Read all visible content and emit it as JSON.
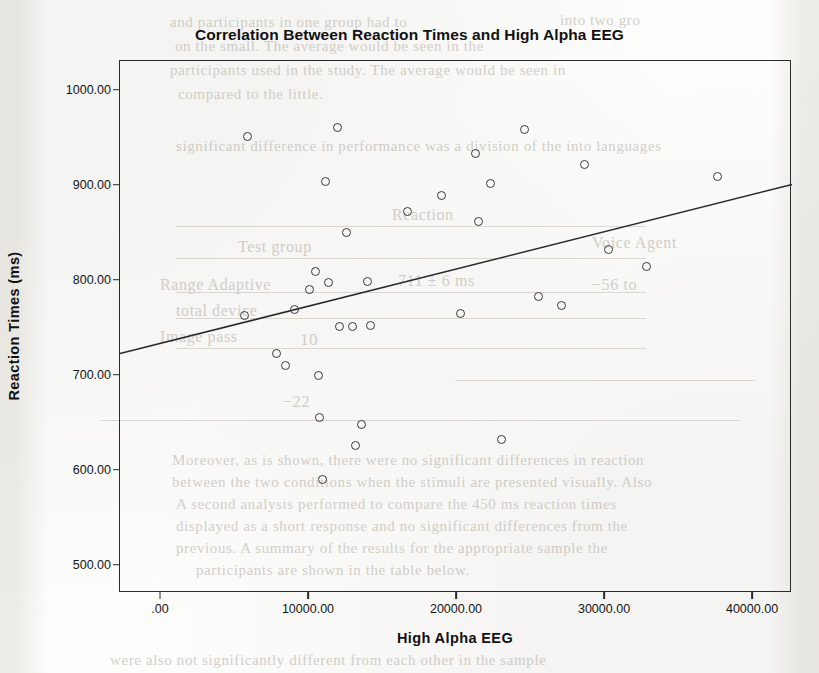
{
  "chart_data": {
    "type": "scatter",
    "title": "Correlation Between Reaction Times and High Alpha EEG",
    "xlabel": "High Alpha EEG",
    "ylabel": "Reaction Times (ms)",
    "grid": false,
    "legend": "none",
    "xlim": [
      -2700,
      42700
    ],
    "ylim": [
      470,
      1030
    ],
    "xticks": [
      0,
      10000,
      20000,
      30000,
      40000
    ],
    "xtick_labels": [
      ".00",
      "10000.00",
      "20000.00",
      "30000.00",
      "40000.00"
    ],
    "yticks": [
      500,
      600,
      700,
      800,
      900,
      1000
    ],
    "ytick_labels": [
      "500.00",
      "600.00",
      "700.00",
      "800.00",
      "900.00",
      "1000.00"
    ],
    "marker": "open-circle",
    "points": [
      {
        "x": 5900,
        "y": 951
      },
      {
        "x": 5700,
        "y": 762
      },
      {
        "x": 7900,
        "y": 722
      },
      {
        "x": 8500,
        "y": 710
      },
      {
        "x": 9100,
        "y": 768
      },
      {
        "x": 10100,
        "y": 790
      },
      {
        "x": 10500,
        "y": 808
      },
      {
        "x": 10700,
        "y": 699
      },
      {
        "x": 10800,
        "y": 655
      },
      {
        "x": 11000,
        "y": 589
      },
      {
        "x": 11200,
        "y": 903
      },
      {
        "x": 11400,
        "y": 797
      },
      {
        "x": 12000,
        "y": 960
      },
      {
        "x": 12100,
        "y": 751
      },
      {
        "x": 12600,
        "y": 849
      },
      {
        "x": 13000,
        "y": 751
      },
      {
        "x": 13200,
        "y": 625
      },
      {
        "x": 13600,
        "y": 647
      },
      {
        "x": 14000,
        "y": 798
      },
      {
        "x": 14200,
        "y": 752
      },
      {
        "x": 16700,
        "y": 872
      },
      {
        "x": 19000,
        "y": 888
      },
      {
        "x": 20300,
        "y": 764
      },
      {
        "x": 21300,
        "y": 933
      },
      {
        "x": 21500,
        "y": 861
      },
      {
        "x": 22300,
        "y": 901
      },
      {
        "x": 23100,
        "y": 632
      },
      {
        "x": 24600,
        "y": 958
      },
      {
        "x": 25600,
        "y": 782
      },
      {
        "x": 27100,
        "y": 773
      },
      {
        "x": 28700,
        "y": 921
      },
      {
        "x": 30300,
        "y": 832
      },
      {
        "x": 32900,
        "y": 814
      },
      {
        "x": 37700,
        "y": 908
      }
    ],
    "fit_line": {
      "type": "linear-regression",
      "x_start": -2700,
      "y_start": 722,
      "x_end": 42700,
      "y_end": 900
    }
  },
  "background_text": {
    "lines": [
      {
        "text": "into two gro",
        "x": 560,
        "y": 12,
        "size": 15
      },
      {
        "text": "and participants in one group had to",
        "x": 170,
        "y": 14,
        "size": 15
      },
      {
        "text": "on the small. The average would be seen in the",
        "x": 175,
        "y": 38,
        "size": 15
      },
      {
        "text": "participants used in the study. The average would be seen in",
        "x": 170,
        "y": 62,
        "size": 15
      },
      {
        "text": "compared to the little.",
        "x": 178,
        "y": 86,
        "size": 15
      },
      {
        "text": "significant difference in performance was a division of the into languages",
        "x": 176,
        "y": 138,
        "size": 15
      },
      {
        "text": "Reaction",
        "x": 392,
        "y": 206,
        "size": 16
      },
      {
        "text": "Test group",
        "x": 238,
        "y": 238,
        "size": 16
      },
      {
        "text": "Voice Agent",
        "x": 592,
        "y": 234,
        "size": 16
      },
      {
        "text": "Range  Adaptive",
        "x": 160,
        "y": 276,
        "size": 16
      },
      {
        "text": "711 ± 6  ms",
        "x": 398,
        "y": 272,
        "size": 16
      },
      {
        "text": "−56 to",
        "x": 592,
        "y": 276,
        "size": 16
      },
      {
        "text": "total device",
        "x": 176,
        "y": 302,
        "size": 16
      },
      {
        "text": "Image     pass",
        "x": 160,
        "y": 328,
        "size": 16
      },
      {
        "text": "10",
        "x": 300,
        "y": 330,
        "size": 17
      },
      {
        "text": "−22",
        "x": 282,
        "y": 392,
        "size": 17
      },
      {
        "text": "Moreover, as is shown, there were no significant differences in reaction",
        "x": 172,
        "y": 452,
        "size": 15
      },
      {
        "text": "between the two conditions when the stimuli are presented visually. Also",
        "x": 172,
        "y": 474,
        "size": 15
      },
      {
        "text": "A second analysis performed to compare the 450 ms reaction times",
        "x": 176,
        "y": 496,
        "size": 15
      },
      {
        "text": "displayed as a short response and no significant differences from the",
        "x": 176,
        "y": 518,
        "size": 15
      },
      {
        "text": "previous. A summary of the results for the appropriate sample the",
        "x": 176,
        "y": 540,
        "size": 15
      },
      {
        "text": "participants are shown in the table below.",
        "x": 196,
        "y": 562,
        "size": 15
      },
      {
        "text": "were also not significantly different from each other in the sample",
        "x": 110,
        "y": 652,
        "size": 15
      }
    ],
    "rules": [
      {
        "x": 176,
        "y": 226,
        "w": 470
      },
      {
        "x": 176,
        "y": 258,
        "w": 470
      },
      {
        "x": 176,
        "y": 292,
        "w": 470
      },
      {
        "x": 176,
        "y": 318,
        "w": 470
      },
      {
        "x": 176,
        "y": 348,
        "w": 470
      },
      {
        "x": 455,
        "y": 380,
        "w": 300
      },
      {
        "x": 100,
        "y": 420,
        "w": 640
      }
    ]
  }
}
